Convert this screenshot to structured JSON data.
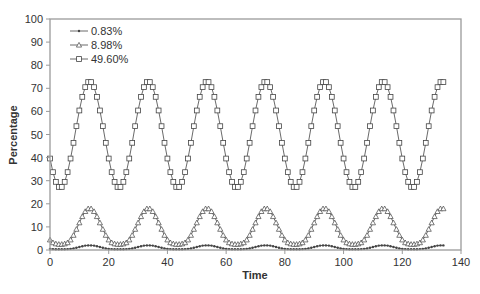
{
  "chart_data": {
    "type": "line",
    "title": "",
    "xlabel": "Time",
    "ylabel": "Percentage",
    "xlim": [
      0,
      140
    ],
    "ylim": [
      0,
      100
    ],
    "xticks": [
      0,
      20,
      40,
      60,
      80,
      100,
      120,
      140
    ],
    "yticks": [
      0,
      10,
      20,
      30,
      40,
      50,
      60,
      70,
      80,
      90,
      100
    ],
    "grid": false,
    "legend_position": "upper-left",
    "x_start": 0,
    "x_step": 1,
    "series": [
      {
        "name": "0.83%",
        "marker": "filled-dot",
        "values": [
          0.5,
          0.4,
          0.3,
          0.3,
          0.3,
          0.3,
          0.4,
          0.5,
          0.7,
          1.0,
          1.3,
          1.6,
          1.9,
          2.0,
          2.0,
          1.9,
          1.6,
          1.3,
          1.0,
          0.7,
          0.5,
          0.4,
          0.3,
          0.3,
          0.3,
          0.3,
          0.4,
          0.5,
          0.7,
          1.0,
          1.3,
          1.6,
          1.9,
          2.0,
          2.0,
          1.9,
          1.6,
          1.3,
          1.0,
          0.7,
          0.5,
          0.4,
          0.3,
          0.3,
          0.3,
          0.3,
          0.4,
          0.5,
          0.7,
          1.0,
          1.3,
          1.6,
          1.9,
          2.0,
          2.0,
          1.9,
          1.6,
          1.3,
          1.0,
          0.7,
          0.5,
          0.4,
          0.3,
          0.3,
          0.3,
          0.3,
          0.4,
          0.5,
          0.7,
          1.0,
          1.3,
          1.6,
          1.9,
          2.0,
          2.0,
          1.9,
          1.6,
          1.3,
          1.0,
          0.7,
          0.5,
          0.4,
          0.3,
          0.3,
          0.3,
          0.3,
          0.4,
          0.5,
          0.7,
          1.0,
          1.3,
          1.6,
          1.9,
          2.0,
          2.0,
          1.9,
          1.6,
          1.3,
          1.0,
          0.7,
          0.5,
          0.4,
          0.3,
          0.3,
          0.3,
          0.3,
          0.4,
          0.5,
          0.7,
          1.0,
          1.3,
          1.6,
          1.9,
          2.0,
          2.0,
          1.9,
          1.6,
          1.3,
          1.0,
          0.7,
          0.5,
          0.4,
          0.3,
          0.3,
          0.3,
          0.3,
          0.4,
          0.5,
          0.7,
          1.0,
          1.3,
          1.6,
          1.9,
          2.0,
          2.0
        ]
      },
      {
        "name": "8.98%",
        "marker": "open-triangle",
        "values": [
          4.4,
          3.2,
          2.7,
          2.5,
          2.5,
          2.7,
          3.2,
          4.4,
          6.4,
          9.0,
          11.8,
          14.5,
          16.7,
          17.9,
          17.9,
          16.7,
          14.5,
          11.8,
          9.0,
          6.4,
          4.4,
          3.2,
          2.7,
          2.5,
          2.5,
          2.7,
          3.2,
          4.4,
          6.4,
          9.0,
          11.8,
          14.5,
          16.7,
          17.9,
          17.9,
          16.7,
          14.5,
          11.8,
          9.0,
          6.4,
          4.4,
          3.2,
          2.7,
          2.5,
          2.5,
          2.7,
          3.2,
          4.4,
          6.4,
          9.0,
          11.8,
          14.5,
          16.7,
          17.9,
          17.9,
          16.7,
          14.5,
          11.8,
          9.0,
          6.4,
          4.4,
          3.2,
          2.7,
          2.5,
          2.5,
          2.7,
          3.2,
          4.4,
          6.4,
          9.0,
          11.8,
          14.5,
          16.7,
          17.9,
          17.9,
          16.7,
          14.5,
          11.8,
          9.0,
          6.4,
          4.4,
          3.2,
          2.7,
          2.5,
          2.5,
          2.7,
          3.2,
          4.4,
          6.4,
          9.0,
          11.8,
          14.5,
          16.7,
          17.9,
          17.9,
          16.7,
          14.5,
          11.8,
          9.0,
          6.4,
          4.4,
          3.2,
          2.7,
          2.5,
          2.5,
          2.7,
          3.2,
          4.4,
          6.4,
          9.0,
          11.8,
          14.5,
          16.7,
          17.9,
          17.9,
          16.7,
          14.5,
          11.8,
          9.0,
          6.4,
          4.4,
          3.2,
          2.7,
          2.5,
          2.5,
          2.7,
          3.2,
          4.4,
          6.4,
          9.0,
          11.8,
          14.5,
          16.7,
          17.9,
          17.9
        ]
      },
      {
        "name": "49.60%",
        "marker": "open-square",
        "values": [
          39.6,
          33.7,
          29.5,
          27.3,
          27.3,
          29.5,
          33.7,
          39.6,
          46.4,
          53.6,
          60.4,
          66.3,
          70.5,
          72.7,
          72.7,
          70.5,
          66.3,
          60.4,
          53.6,
          46.4,
          39.6,
          33.7,
          29.5,
          27.3,
          27.3,
          29.5,
          33.7,
          39.6,
          46.4,
          53.6,
          60.4,
          66.3,
          70.5,
          72.7,
          72.7,
          70.5,
          66.3,
          60.4,
          53.6,
          46.4,
          39.6,
          33.7,
          29.5,
          27.3,
          27.3,
          29.5,
          33.7,
          39.6,
          46.4,
          53.6,
          60.4,
          66.3,
          70.5,
          72.7,
          72.7,
          70.5,
          66.3,
          60.4,
          53.6,
          46.4,
          39.6,
          33.7,
          29.5,
          27.3,
          27.3,
          29.5,
          33.7,
          39.6,
          46.4,
          53.6,
          60.4,
          66.3,
          70.5,
          72.7,
          72.7,
          70.5,
          66.3,
          60.4,
          53.6,
          46.4,
          39.6,
          33.7,
          29.5,
          27.3,
          27.3,
          29.5,
          33.7,
          39.6,
          46.4,
          53.6,
          60.4,
          66.3,
          70.5,
          72.7,
          72.7,
          70.5,
          66.3,
          60.4,
          53.6,
          46.4,
          39.6,
          33.7,
          29.5,
          27.3,
          27.3,
          29.5,
          33.7,
          39.6,
          46.4,
          53.6,
          60.4,
          66.3,
          70.5,
          72.7,
          72.7,
          70.5,
          66.3,
          60.4,
          53.6,
          46.4,
          39.6,
          33.7,
          29.5,
          27.3,
          27.3,
          29.5,
          33.7,
          39.6,
          46.4,
          53.6,
          60.4,
          66.3,
          70.5,
          72.7,
          72.7
        ]
      }
    ]
  },
  "colors": {
    "axis": "#9a9a9a",
    "line": "#444444",
    "text": "#333333"
  }
}
